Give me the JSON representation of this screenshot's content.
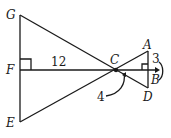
{
  "diagram": {
    "points": {
      "G": {
        "label": "G",
        "x": 20,
        "y": 15
      },
      "F": {
        "label": "F",
        "x": 20,
        "y": 70
      },
      "E": {
        "label": "E",
        "x": 20,
        "y": 122
      },
      "C": {
        "label": "C",
        "x": 116,
        "y": 70
      },
      "A": {
        "label": "A",
        "x": 148,
        "y": 51
      },
      "B": {
        "label": "B",
        "x": 148,
        "y": 70
      },
      "D": {
        "label": "D",
        "x": 148,
        "y": 88
      }
    },
    "measures": {
      "FC": "12",
      "AB": "3",
      "CB": "4"
    },
    "colors": {
      "stroke": "#1a1a1a",
      "background": "#ffffff"
    }
  }
}
